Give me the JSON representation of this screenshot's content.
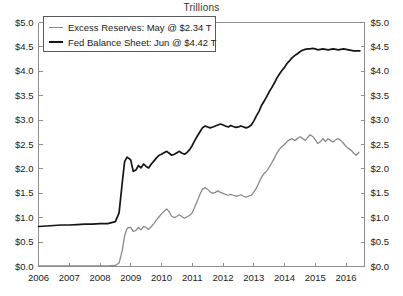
{
  "chart_data": {
    "type": "line",
    "title": "Trillions",
    "xlabel": "",
    "ylabel": "",
    "xlim": [
      2006.0,
      2016.6
    ],
    "ylim": [
      0.0,
      5.0
    ],
    "ytick_step": 0.5,
    "grid": false,
    "legend_position": "upper-left",
    "dual_axis": true,
    "xticks": [
      "2006",
      "2007",
      "2008",
      "2009",
      "2010",
      "2011",
      "2012",
      "2013",
      "2014",
      "2015",
      "2016"
    ],
    "xtick_values": [
      2006,
      2007,
      2008,
      2009,
      2010,
      2011,
      2012,
      2013,
      2014,
      2015,
      2016
    ],
    "yticks_left": [
      "$0.0",
      "$0.5",
      "$1.0",
      "$1.5",
      "$2.0",
      "$2.5",
      "$3.0",
      "$3.5",
      "$4.0",
      "$4.5",
      "$5.0"
    ],
    "yticks_right": [
      "$0.0",
      "$0.5",
      "$1.0",
      "$1.5",
      "$2.0",
      "$2.5",
      "$3.0",
      "$3.5",
      "$4.0",
      "$4.5",
      "$5.0"
    ],
    "ytick_values": [
      0.0,
      0.5,
      1.0,
      1.5,
      2.0,
      2.5,
      3.0,
      3.5,
      4.0,
      4.5,
      5.0
    ],
    "series": [
      {
        "name": "Excess Reserves",
        "legend_label": "Excess Reserves: May @ $2.34 T",
        "latest_period": "May",
        "latest_value": 2.34,
        "units": "T",
        "color": "#8a8a8a",
        "linewidth": 1.3,
        "x": [
          2006.0,
          2006.25,
          2006.5,
          2006.75,
          2007.0,
          2007.25,
          2007.5,
          2007.75,
          2008.0,
          2008.25,
          2008.5,
          2008.62,
          2008.72,
          2008.8,
          2008.88,
          2008.95,
          2009.0,
          2009.08,
          2009.17,
          2009.25,
          2009.33,
          2009.42,
          2009.5,
          2009.58,
          2009.67,
          2009.75,
          2009.83,
          2009.92,
          2010.0,
          2010.08,
          2010.17,
          2010.25,
          2010.33,
          2010.42,
          2010.5,
          2010.58,
          2010.67,
          2010.75,
          2010.83,
          2010.92,
          2011.0,
          2011.08,
          2011.17,
          2011.25,
          2011.33,
          2011.42,
          2011.5,
          2011.58,
          2011.67,
          2011.75,
          2011.83,
          2011.92,
          2012.0,
          2012.08,
          2012.17,
          2012.25,
          2012.33,
          2012.42,
          2012.5,
          2012.58,
          2012.67,
          2012.75,
          2012.83,
          2012.92,
          2013.0,
          2013.08,
          2013.17,
          2013.25,
          2013.33,
          2013.42,
          2013.5,
          2013.58,
          2013.67,
          2013.75,
          2013.83,
          2013.92,
          2014.0,
          2014.08,
          2014.17,
          2014.25,
          2014.33,
          2014.42,
          2014.5,
          2014.58,
          2014.67,
          2014.75,
          2014.83,
          2014.92,
          2015.0,
          2015.08,
          2015.17,
          2015.25,
          2015.33,
          2015.42,
          2015.5,
          2015.58,
          2015.67,
          2015.75,
          2015.83,
          2015.92,
          2016.0,
          2016.08,
          2016.17,
          2016.25,
          2016.33,
          2016.42
        ],
        "y": [
          0.012,
          0.012,
          0.013,
          0.012,
          0.013,
          0.013,
          0.013,
          0.013,
          0.014,
          0.014,
          0.02,
          0.07,
          0.32,
          0.63,
          0.78,
          0.8,
          0.8,
          0.72,
          0.74,
          0.8,
          0.75,
          0.82,
          0.8,
          0.76,
          0.82,
          0.88,
          0.95,
          1.02,
          1.08,
          1.13,
          1.18,
          1.12,
          1.03,
          1.0,
          1.03,
          1.06,
          1.02,
          0.99,
          1.02,
          1.05,
          1.1,
          1.22,
          1.35,
          1.48,
          1.58,
          1.62,
          1.58,
          1.53,
          1.5,
          1.52,
          1.55,
          1.52,
          1.5,
          1.48,
          1.46,
          1.48,
          1.46,
          1.44,
          1.45,
          1.47,
          1.44,
          1.42,
          1.44,
          1.46,
          1.52,
          1.6,
          1.72,
          1.83,
          1.9,
          1.96,
          2.03,
          2.12,
          2.22,
          2.32,
          2.4,
          2.46,
          2.5,
          2.56,
          2.6,
          2.62,
          2.58,
          2.62,
          2.66,
          2.63,
          2.58,
          2.64,
          2.7,
          2.66,
          2.6,
          2.52,
          2.56,
          2.62,
          2.56,
          2.62,
          2.58,
          2.55,
          2.6,
          2.62,
          2.58,
          2.52,
          2.46,
          2.42,
          2.38,
          2.32,
          2.28,
          2.34
        ]
      },
      {
        "name": "Fed Balance Sheet",
        "legend_label": "Fed Balance Sheet: Jun @ $4.42 T",
        "latest_period": "Jun",
        "latest_value": 4.42,
        "units": "T",
        "color": "#151515",
        "linewidth": 1.7,
        "x": [
          2006.0,
          2006.25,
          2006.5,
          2006.75,
          2007.0,
          2007.25,
          2007.5,
          2007.75,
          2008.0,
          2008.25,
          2008.5,
          2008.62,
          2008.72,
          2008.8,
          2008.88,
          2008.95,
          2009.0,
          2009.08,
          2009.17,
          2009.25,
          2009.33,
          2009.42,
          2009.5,
          2009.58,
          2009.67,
          2009.75,
          2009.83,
          2009.92,
          2010.0,
          2010.08,
          2010.17,
          2010.25,
          2010.33,
          2010.42,
          2010.5,
          2010.58,
          2010.67,
          2010.75,
          2010.83,
          2010.92,
          2011.0,
          2011.08,
          2011.17,
          2011.25,
          2011.33,
          2011.42,
          2011.5,
          2011.58,
          2011.67,
          2011.75,
          2011.83,
          2011.92,
          2012.0,
          2012.08,
          2012.17,
          2012.25,
          2012.33,
          2012.42,
          2012.5,
          2012.58,
          2012.67,
          2012.75,
          2012.83,
          2012.92,
          2013.0,
          2013.08,
          2013.17,
          2013.25,
          2013.33,
          2013.42,
          2013.5,
          2013.58,
          2013.67,
          2013.75,
          2013.83,
          2013.92,
          2014.0,
          2014.08,
          2014.17,
          2014.25,
          2014.33,
          2014.42,
          2014.5,
          2014.58,
          2014.67,
          2014.75,
          2014.83,
          2014.92,
          2015.0,
          2015.08,
          2015.17,
          2015.25,
          2015.33,
          2015.42,
          2015.5,
          2015.58,
          2015.67,
          2015.75,
          2015.83,
          2015.92,
          2016.0,
          2016.08,
          2016.17,
          2016.25,
          2016.33,
          2016.45
        ],
        "y": [
          0.82,
          0.83,
          0.84,
          0.85,
          0.85,
          0.86,
          0.87,
          0.87,
          0.88,
          0.88,
          0.92,
          1.1,
          1.7,
          2.15,
          2.24,
          2.21,
          2.18,
          1.95,
          1.98,
          2.07,
          2.02,
          2.1,
          2.05,
          2.02,
          2.1,
          2.16,
          2.22,
          2.28,
          2.3,
          2.33,
          2.36,
          2.32,
          2.28,
          2.3,
          2.33,
          2.36,
          2.32,
          2.3,
          2.34,
          2.4,
          2.48,
          2.58,
          2.68,
          2.76,
          2.84,
          2.88,
          2.86,
          2.84,
          2.86,
          2.88,
          2.9,
          2.92,
          2.9,
          2.88,
          2.86,
          2.89,
          2.87,
          2.85,
          2.86,
          2.88,
          2.86,
          2.84,
          2.86,
          2.9,
          2.98,
          3.08,
          3.18,
          3.3,
          3.38,
          3.48,
          3.58,
          3.66,
          3.76,
          3.86,
          3.94,
          4.02,
          4.08,
          4.16,
          4.22,
          4.28,
          4.32,
          4.36,
          4.4,
          4.43,
          4.45,
          4.46,
          4.46,
          4.47,
          4.46,
          4.44,
          4.45,
          4.46,
          4.45,
          4.44,
          4.45,
          4.46,
          4.45,
          4.44,
          4.45,
          4.46,
          4.45,
          4.44,
          4.43,
          4.42,
          4.42,
          4.42
        ]
      }
    ]
  },
  "legend": {
    "items": [
      {
        "label": "Excess Reserves: May @ $2.34 T",
        "color": "#8a8a8a",
        "width": 1.5
      },
      {
        "label": "Fed Balance Sheet: Jun @ $4.42 T",
        "color": "#151515",
        "width": 2.0
      }
    ]
  },
  "axis": {
    "spine_color": "#8d8d8d",
    "tick_color": "#8d8d8d",
    "text_color": "#222222"
  }
}
